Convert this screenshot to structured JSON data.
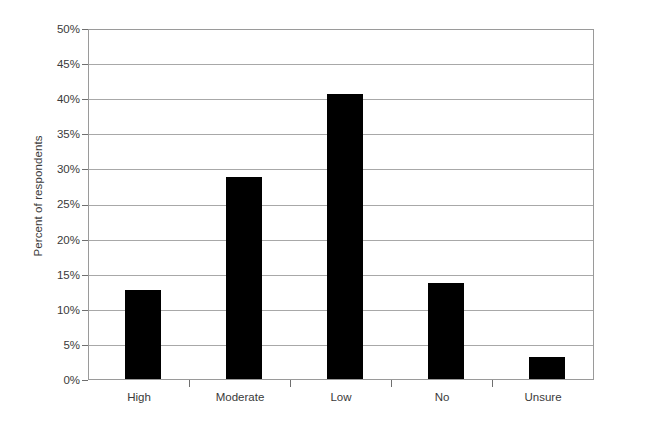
{
  "chart_data": {
    "type": "bar",
    "title": "",
    "subtitle": "",
    "xlabel": "",
    "ylabel": "Percent of respondents",
    "categories": [
      "High",
      "Moderate",
      "Low",
      "No",
      "Unsure"
    ],
    "values": [
      12.8,
      29.0,
      40.8,
      13.8,
      3.1
    ],
    "ylim": [
      0,
      50
    ],
    "ytick_labels": [
      "0%",
      "5%",
      "10%",
      "15%",
      "20%",
      "25%",
      "30%",
      "35%",
      "40%",
      "45%",
      "50%"
    ],
    "ytick_values": [
      0,
      5,
      10,
      15,
      20,
      25,
      30,
      35,
      40,
      45,
      50
    ],
    "grid": true,
    "grid_axis": "y",
    "legend": false,
    "legend_position": "none",
    "bar_color": "#000000",
    "grid_color": "#a8a8a8",
    "frame_color": "#9a9a9a",
    "text_color": "#3a3a3a",
    "background": "#ffffff",
    "annotations": []
  }
}
